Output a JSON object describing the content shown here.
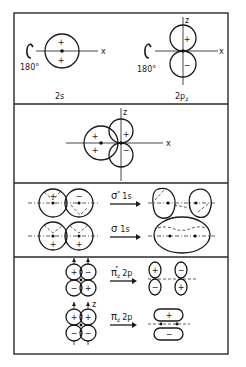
{
  "figure": {
    "panels": [
      {
        "id": "atomic-orbitals",
        "items": [
          {
            "label": "2s",
            "rotation": "180°",
            "axis_x": "x",
            "signs": [
              "+",
              "+"
            ]
          },
          {
            "label": "2p",
            "subscript": "z",
            "rotation": "180°",
            "axis_x": "x",
            "axis_z": "z",
            "signs": [
              "+",
              "−"
            ]
          }
        ]
      },
      {
        "id": "sp-overlap",
        "axis_x": "x",
        "axis_z": "z",
        "signs": [
          "+",
          "+",
          "+",
          "−"
        ]
      },
      {
        "id": "sigma-1s",
        "rows": [
          {
            "arrow_label": "σ",
            "superscript": "*",
            "suffix": "1s",
            "signs_left": [
              "+",
              "−"
            ]
          },
          {
            "arrow_label": "σ",
            "suffix": "1s",
            "signs_left": [
              "+",
              "+"
            ]
          }
        ]
      },
      {
        "id": "pi-2p",
        "rows": [
          {
            "arrow_label": "π",
            "subscript": "z",
            "superscript": "*",
            "suffix": "2p",
            "signs_left": [
              "+",
              "−",
              "−",
              "+"
            ],
            "signs_right": [
              "+",
              "−",
              "−",
              "+"
            ]
          },
          {
            "arrow_label": "π",
            "subscript": "z",
            "suffix": "2p",
            "axis_z": "z",
            "signs_left": [
              "+",
              "+",
              "−",
              "−"
            ],
            "signs_right": [
              "+",
              "−"
            ]
          }
        ]
      }
    ]
  },
  "colors": {
    "ink": "#1a1a1a",
    "background": "#ffffff"
  }
}
